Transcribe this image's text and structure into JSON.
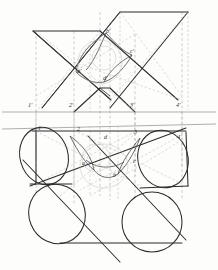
{
  "drawing": {
    "title": "Intersection of two cylinders - orthographic projection",
    "views": {
      "elevation": "front elevation (upper)",
      "plan": "plan view (lower)"
    },
    "colors": {
      "outline": "#2b2b2b",
      "construction": "#9a9a9a",
      "hidden": "#b0b0b0",
      "ground_line": "#808080",
      "label": "#2a2a2a"
    }
  },
  "labels": {
    "elevation": [
      {
        "id": "p1e",
        "text": "1'",
        "x": 28,
        "y": 104
      },
      {
        "id": "p2e",
        "text": "2'",
        "x": 69,
        "y": 104
      },
      {
        "id": "p3e",
        "text": "3'",
        "x": 133,
        "y": 104
      },
      {
        "id": "p4e",
        "text": "4'",
        "x": 177,
        "y": 104
      },
      {
        "id": "pae",
        "text": "a'",
        "x": 78,
        "y": 69
      },
      {
        "id": "pbe",
        "text": "b'",
        "x": 107,
        "y": 30
      },
      {
        "id": "pce",
        "text": "c'",
        "x": 131,
        "y": 50
      },
      {
        "id": "pde",
        "text": "d'",
        "x": 105,
        "y": 76
      }
    ],
    "plan": [
      {
        "id": "p1p",
        "text": "1",
        "x": 38,
        "y": 127
      },
      {
        "id": "p2p",
        "text": "2",
        "x": 77,
        "y": 128
      },
      {
        "id": "p3p",
        "text": "3",
        "x": 134,
        "y": 131
      },
      {
        "id": "p4p",
        "text": "4",
        "x": 177,
        "y": 136
      },
      {
        "id": "pap",
        "text": "a",
        "x": 82,
        "y": 162
      },
      {
        "id": "pbp",
        "text": "b",
        "x": 113,
        "y": 174
      },
      {
        "id": "pcp",
        "text": "c",
        "x": 133,
        "y": 160
      },
      {
        "id": "pdp",
        "text": "d",
        "x": 105,
        "y": 136
      }
    ]
  },
  "geometry": {
    "ground_line_y": 112,
    "plan_axis_line_y": 126,
    "ordinate_x": [
      36,
      74,
      135,
      182
    ],
    "elevation_prism_a": [
      [
        33,
        31
      ],
      [
        100,
        31
      ],
      [
        178,
        96
      ],
      [
        111,
        96
      ]
    ],
    "elevation_prism_b": [
      [
        120,
        12
      ],
      [
        188,
        12
      ],
      [
        110,
        96
      ],
      [
        42,
        96
      ]
    ],
    "plan_cylinder_left_top": {
      "cx": 44,
      "cy": 155,
      "rx": 24,
      "ry": 29,
      "rot": -18
    },
    "plan_cylinder_right_top": {
      "cx": 163,
      "cy": 158,
      "rx": 24,
      "ry": 29,
      "rot": -18
    },
    "plan_cylinder_left_bot": {
      "cx": 56,
      "cy": 215,
      "rx": 28,
      "ry": 30,
      "rot": -20
    },
    "plan_cylinder_right_bot": {
      "cx": 152,
      "cy": 222,
      "rx": 30,
      "ry": 30,
      "rot": 0
    }
  }
}
